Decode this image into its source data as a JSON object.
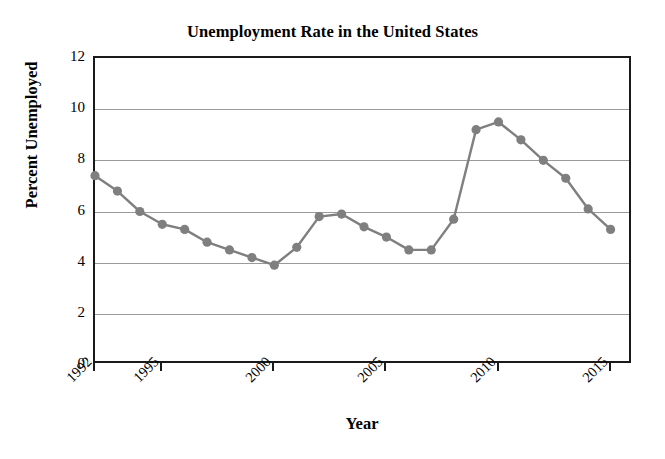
{
  "chart_data": {
    "type": "line",
    "title": "Unemployment Rate in the United States",
    "xlabel": "Year",
    "ylabel": "Percent Unemployed",
    "x": [
      1992,
      1993,
      1994,
      1995,
      1996,
      1997,
      1998,
      1999,
      2000,
      2001,
      2002,
      2003,
      2004,
      2005,
      2006,
      2007,
      2008,
      2009,
      2010,
      2011,
      2012,
      2013,
      2014,
      2015
    ],
    "values": [
      7.4,
      6.8,
      6.0,
      5.5,
      5.3,
      4.8,
      4.5,
      4.2,
      3.9,
      4.6,
      5.8,
      5.9,
      5.4,
      5.0,
      4.5,
      4.5,
      5.7,
      9.2,
      9.5,
      8.8,
      8.0,
      7.3,
      6.1,
      5.3
    ],
    "series": [
      {
        "name": "Percent Unemployed",
        "values": [
          7.4,
          6.8,
          6.0,
          5.5,
          5.3,
          4.8,
          4.5,
          4.2,
          3.9,
          4.6,
          5.8,
          5.9,
          5.4,
          5.0,
          4.5,
          4.5,
          5.7,
          9.2,
          9.5,
          8.8,
          8.0,
          7.3,
          6.1,
          5.3
        ]
      }
    ],
    "xlim": [
      1992,
      2016
    ],
    "ylim": [
      0,
      12
    ],
    "ytick_labels": [
      "0",
      "2",
      "4",
      "6",
      "8",
      "10",
      "12"
    ],
    "ytick_values": [
      0,
      2,
      4,
      6,
      8,
      10,
      12
    ],
    "xtick_labels": [
      "1992",
      "1995",
      "2000",
      "2005",
      "2010",
      "2015"
    ],
    "xtick_values": [
      1992,
      1995,
      2000,
      2005,
      2010,
      2015
    ],
    "grid": "horizontal",
    "legend": "none",
    "marker": "circle",
    "colors": {
      "line": "#7f7f7f",
      "marker": "#7f7f7f",
      "grid": "#9a9a9a",
      "frame": "#1a1a1a",
      "background": "#ffffff",
      "text": "#000000"
    }
  }
}
